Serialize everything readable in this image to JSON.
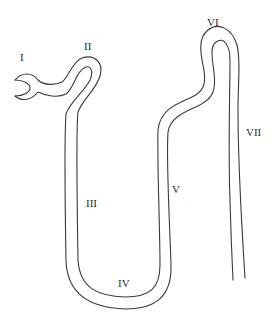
{
  "diagram": {
    "stroke_color": "#3a3a3a",
    "background": "#ffffff",
    "labels": [
      {
        "id": "I",
        "text": "I",
        "x": 20,
        "y": 52
      },
      {
        "id": "II",
        "text": "II",
        "x": 84,
        "y": 41
      },
      {
        "id": "III",
        "text": "III",
        "x": 86,
        "y": 198
      },
      {
        "id": "IV",
        "text": "IV",
        "x": 118,
        "y": 278
      },
      {
        "id": "V",
        "text": "V",
        "x": 172,
        "y": 184
      },
      {
        "id": "VI",
        "text": "VI",
        "x": 207,
        "y": 17
      },
      {
        "id": "VII",
        "text": "VII",
        "x": 246,
        "y": 127
      }
    ]
  }
}
